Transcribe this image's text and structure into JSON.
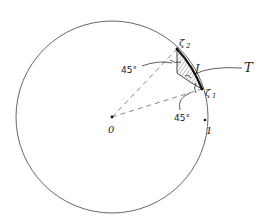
{
  "diagram": {
    "type": "geometric-sketch",
    "circle": {
      "cx": 112,
      "cy": 117,
      "r": 96,
      "stroke": "#555555"
    },
    "points": {
      "origin": {
        "label": "0",
        "x": 112,
        "y": 117
      },
      "zeta1": {
        "label": "ζ",
        "sub": "1",
        "x": 202,
        "y": 89
      },
      "zeta2": {
        "label": "ζ",
        "sub": "2",
        "x": 177,
        "y": 49
      },
      "one": {
        "label": "1",
        "x": 206,
        "y": 120
      }
    },
    "labels": {
      "arc_label": "J",
      "region_label": "T",
      "angle_top": "45°",
      "angle_bottom": "45°"
    },
    "colors": {
      "ink": "#222222",
      "hatch": "#666666",
      "dash": "#666666"
    }
  }
}
